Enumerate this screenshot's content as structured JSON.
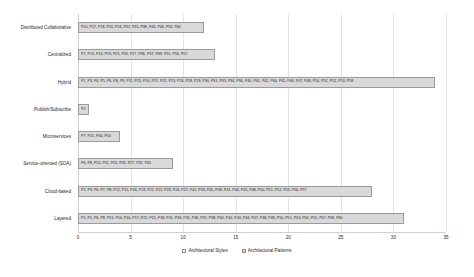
{
  "chart_data": {
    "type": "bar",
    "orientation": "horizontal",
    "title": "",
    "xlabel": "",
    "ylabel": "",
    "xlim": [
      0,
      35
    ],
    "xticks": [
      "0",
      "5",
      "10",
      "15",
      "20",
      "25",
      "30",
      "35"
    ],
    "grid": true,
    "legend_position": "bottom",
    "legend": [
      "Architectural Styles",
      "Architectural Patterns"
    ],
    "categories": [
      "Distributed Collaborative",
      "Centralized",
      "Hybrid",
      "Publish/Subscribe",
      "Microservices",
      "Service-oriented (SOA)",
      "Cloud-based",
      "Layered"
    ],
    "values": [
      12,
      13,
      34,
      1,
      4,
      9,
      28,
      31
    ],
    "series": [
      {
        "name": "Architectural Patterns",
        "values": [
          12,
          13,
          34,
          1,
          4,
          9,
          28,
          31
        ]
      }
    ],
    "bar_labels": [
      "P10, P17, P18, P20, P24, P32, P35, P38, P43, P46, P59, P60",
      "P7, P13, P14, P19, P25, P26, P27, P36, P37, P39, P55, P56, P57",
      "P2, P3, P4, P5, P6, P8, P9, P11, P15, P16,  P21, P22, P23, P24, P28, P29, P30, P31, P33, P34, P36, P40, P41, P42, P44, P45, P46, P47, P48, P50, P51, P52, P53, P58",
      "P2",
      "P7, P21, P40, P56",
      "P6, P8, P10, P11, P13, P26, P27, P32, P45",
      "P2, P3, P6, P7, P8, P12, P15, P16, P19, P21, P22, P23, P24, P27, P41, P33, P45, P39, P41, P44, P45, P48, P50, P51, P52, P53, P56, P57",
      "P1, P5, P6, P9, P13, P14, P16, P17, P22, P25, P28, P31, P33, P35, P36, P37, P38, P40, P42, P43, P44, P47, P48, P49, P50, P51, P53, P54, P55, P57, P58, P60"
    ]
  }
}
